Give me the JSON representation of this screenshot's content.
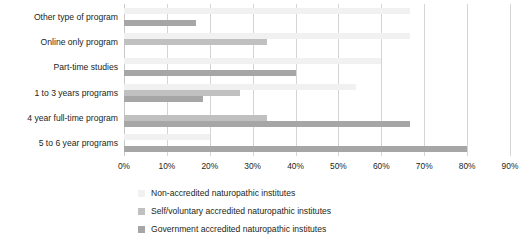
{
  "chart_data": {
    "type": "bar",
    "orientation": "horizontal",
    "title": "",
    "xlabel": "",
    "ylabel": "",
    "xlim": [
      0,
      90
    ],
    "xtick_labels": [
      "0%",
      "10%",
      "20%",
      "30%",
      "40%",
      "50%",
      "60%",
      "70%",
      "80%",
      "90%"
    ],
    "xtick_values": [
      0,
      10,
      20,
      30,
      40,
      50,
      60,
      70,
      80,
      90
    ],
    "grid": true,
    "legend_position": "bottom",
    "categories": [
      "Other type of program",
      "Online only program",
      "Part-time studies",
      "1 to 3 years programs",
      "4 year full-time program",
      "5 to 6 year programs"
    ],
    "series": [
      {
        "name": "Non-accredited naturopathic institutes",
        "color": "#f1f1f1",
        "values": [
          66.7,
          66.7,
          60.0,
          54.0,
          0,
          20.0
        ]
      },
      {
        "name": "Self/voluntary accredited naturopathic institutes",
        "color": "#c0c0c0",
        "values": [
          0,
          33.3,
          0,
          27.0,
          33.3,
          0
        ]
      },
      {
        "name": "Government accredited naturopathic institutes",
        "color": "#a6a6a6",
        "values": [
          16.7,
          0,
          40.0,
          18.5,
          66.7,
          80.0
        ]
      }
    ]
  },
  "legend": {
    "items": [
      {
        "label": "Non-accredited naturopathic institutes",
        "swatch": "legend-swatch-non-accredited"
      },
      {
        "label": "Self/voluntary accredited naturopathic institutes",
        "swatch": "legend-swatch-self-voluntary"
      },
      {
        "label": "Government accredited naturopathic institutes",
        "swatch": "legend-swatch-government"
      }
    ]
  }
}
